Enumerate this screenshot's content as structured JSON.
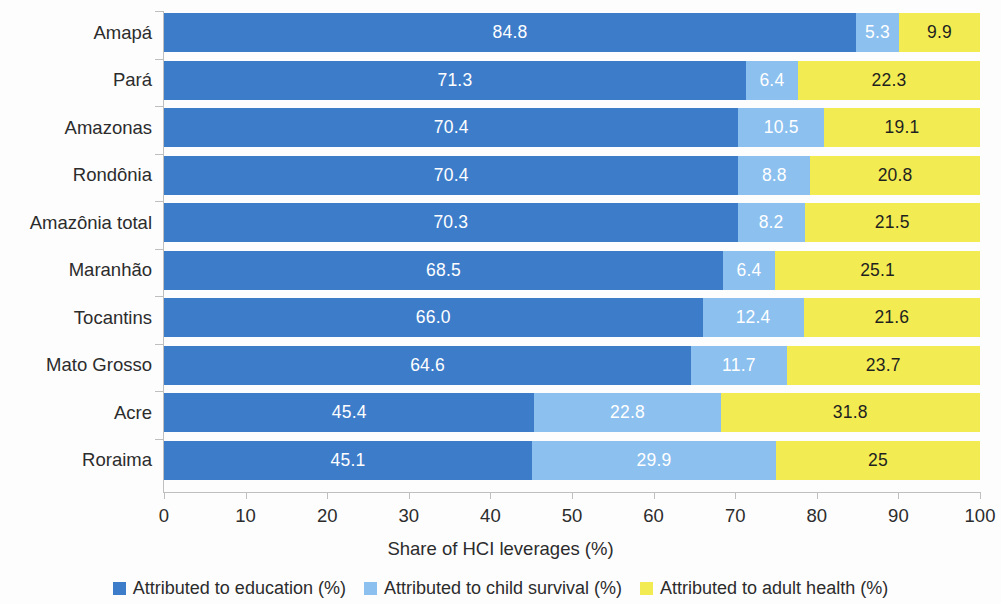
{
  "chart_data": {
    "type": "bar",
    "subtype": "horizontal-stacked-100",
    "title": "",
    "xlabel": "Share of HCI leverages (%)",
    "ylabel": "",
    "xlim": [
      0,
      100
    ],
    "xticks": [
      "0",
      "10",
      "20",
      "30",
      "40",
      "50",
      "60",
      "70",
      "80",
      "90",
      "100"
    ],
    "grid": false,
    "legend_position": "bottom",
    "categories": [
      "Amapá",
      "Pará",
      "Amazonas",
      "Rondônia",
      "Amazônia total",
      "Maranhão",
      "Tocantins",
      "Mato Grosso",
      "Acre",
      "Roraima"
    ],
    "series": [
      {
        "name": "Attributed to education (%)",
        "color": "#3d7cc9",
        "values": [
          84.8,
          71.3,
          70.4,
          70.4,
          70.3,
          68.5,
          66.0,
          64.6,
          45.4,
          45.1
        ],
        "labels": [
          "84.8",
          "71.3",
          "70.4",
          "70.4",
          "70.3",
          "68.5",
          "66.0",
          "64.6",
          "45.4",
          "45.1"
        ]
      },
      {
        "name": "Attributed to child survival (%)",
        "color": "#8cc0ef",
        "values": [
          5.3,
          6.4,
          10.5,
          8.8,
          8.2,
          6.4,
          12.4,
          11.7,
          22.8,
          29.9
        ],
        "labels": [
          "5.3",
          "6.4",
          "10.5",
          "8.8",
          "8.2",
          "6.4",
          "12.4",
          "11.7",
          "22.8",
          "29.9"
        ]
      },
      {
        "name": "Attributed to adult health (%)",
        "color": "#f2ec52",
        "values": [
          9.9,
          22.3,
          19.1,
          20.8,
          21.5,
          25.1,
          21.6,
          23.7,
          31.8,
          25.0
        ],
        "labels": [
          "9.9",
          "22.3",
          "19.1",
          "20.8",
          "21.5",
          "25.1",
          "21.6",
          "23.7",
          "31.8",
          "25"
        ]
      }
    ]
  },
  "legend": {
    "items": [
      {
        "label": "Attributed to education (%)",
        "color": "#3d7cc9"
      },
      {
        "label": "Attributed to child survival (%)",
        "color": "#8cc0ef"
      },
      {
        "label": "Attributed to adult health (%)",
        "color": "#f2ec52"
      }
    ]
  }
}
